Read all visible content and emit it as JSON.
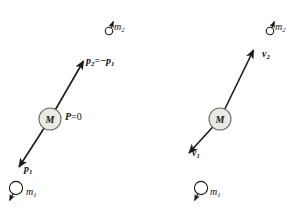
{
  "figure": {
    "type": "physics-vector-diagram",
    "background_color": "#ffffff",
    "stroke_color": "#1a1a1a",
    "mass_circle_fill": "#ebe9e4",
    "mass_circle_stroke": "#6d6b68"
  },
  "panels": {
    "left": {
      "name": "momentum-frame",
      "center_body_label": "M",
      "labels": {
        "incoming_particle": {
          "symbol": "m",
          "subscript": "2"
        },
        "momentum_out": {
          "symbol": "p",
          "subscript": "2",
          "relation": "=",
          "equals_symbol": "−p",
          "equals_subscript": "1"
        },
        "total_momentum": {
          "symbol": "P",
          "relation": "=",
          "value": "0"
        },
        "momentum_in": {
          "symbol": "p",
          "subscript": "1"
        },
        "outgoing_particle": {
          "symbol": "m",
          "subscript": "1"
        }
      }
    },
    "right": {
      "name": "velocity-frame",
      "center_body_label": "M",
      "labels": {
        "incoming_particle": {
          "symbol": "m",
          "subscript": "2"
        },
        "velocity_out": {
          "symbol": "v",
          "subscript": "2"
        },
        "velocity_in": {
          "symbol": "v",
          "subscript": "1"
        },
        "outgoing_particle": {
          "symbol": "m",
          "subscript": "1"
        }
      }
    }
  },
  "geometry": {
    "left_axis": {
      "x1": 18,
      "y1": 166,
      "x2": 83,
      "y2": 61
    },
    "right_axis": {
      "x1": 188,
      "y1": 152,
      "x2": 253,
      "y2": 47
    },
    "left_mass_center": {
      "cx": 50,
      "cy": 119,
      "r": 11
    },
    "right_mass_center": {
      "cx": 220,
      "cy": 119,
      "r": 11
    },
    "left_small_mass": {
      "cx": 16,
      "cy": 188,
      "r": 7
    },
    "right_small_mass": {
      "cx": 201,
      "cy": 188,
      "r": 7
    },
    "left_top_particle": {
      "cx": 109,
      "cy": 30,
      "r": 4
    },
    "right_top_particle": {
      "cx": 270,
      "cy": 30,
      "r": 4
    }
  }
}
